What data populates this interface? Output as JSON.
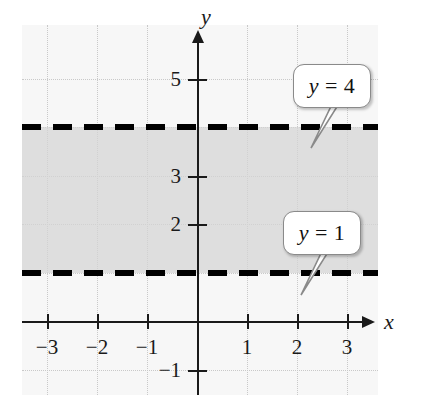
{
  "chart_data": {
    "type": "line",
    "title": "",
    "subtitle": "",
    "xlabel": "x",
    "ylabel": "y",
    "xlim": [
      -3.5,
      3.6
    ],
    "ylim": [
      -1.6,
      5.6
    ],
    "grid": true,
    "legend_position": "none",
    "x_ticks": [
      -3,
      -2,
      -1,
      1,
      2,
      3
    ],
    "x_tick_labels": [
      "−3",
      "−2",
      "−1",
      "1",
      "2",
      "3"
    ],
    "y_ticks": [
      -1,
      2,
      3,
      5
    ],
    "y_tick_labels": [
      "−1",
      "2",
      "3",
      "5"
    ],
    "series": [
      {
        "name": "y = 4",
        "type": "horizontal-line",
        "value": 4,
        "style": "dashed",
        "color": "#000000",
        "label": "y = 4"
      },
      {
        "name": "y = 1",
        "type": "horizontal-line",
        "value": 1,
        "style": "dashed",
        "color": "#000000",
        "label": "y = 1"
      }
    ],
    "shaded_regions": [
      {
        "name": "solution-band",
        "y_from": 1,
        "y_to": 4,
        "color": "#d4d4d4",
        "description": "region between y = 1 and y = 4"
      }
    ],
    "annotations": [
      {
        "name": "callout-y4",
        "text": "y = 4",
        "var": "y",
        "rest": " = 4",
        "points_to_y": 4
      },
      {
        "name": "callout-y1",
        "text": "y = 1",
        "var": "y",
        "rest": " = 1",
        "points_to_y": 1
      }
    ],
    "colors": {
      "plot_background": "#f7f7f7",
      "grid": "#c9c9c9",
      "axis": "#1a1a1a",
      "shading": "#d4d4d4",
      "line": "#000000",
      "callout_border": "#8a8a8a",
      "callout_fill": "#ffffff"
    }
  },
  "axes": {
    "x_name": "x",
    "y_name": "y"
  },
  "ticks": {
    "x": [
      {
        "label": "−3",
        "value": -3
      },
      {
        "label": "−2",
        "value": -2
      },
      {
        "label": "−1",
        "value": -1
      },
      {
        "label": "1",
        "value": 1
      },
      {
        "label": "2",
        "value": 2
      },
      {
        "label": "3",
        "value": 3
      }
    ],
    "y": [
      {
        "label": "5",
        "value": 5
      },
      {
        "label": "3",
        "value": 3
      },
      {
        "label": "2",
        "value": 2
      },
      {
        "label": "−1",
        "value": -1
      }
    ]
  },
  "callouts": [
    {
      "name": "callout-y4",
      "var": "y",
      "rest": " = 4"
    },
    {
      "name": "callout-y1",
      "var": "y",
      "rest": " = 1"
    }
  ]
}
